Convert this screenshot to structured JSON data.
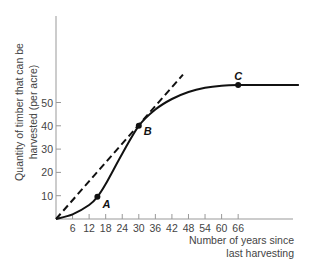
{
  "chart_data": {
    "type": "line",
    "title": "",
    "xlabel": "Number of years since last harvesting",
    "xlabel_lines": [
      "Number of years since",
      "last harvesting"
    ],
    "ylabel": "Quantity of timber that can be harvested (per acre)",
    "ylabel_lines": [
      "Quantity of timber that can be",
      "harvested (per acre)"
    ],
    "x_ticks": [
      6,
      12,
      18,
      24,
      30,
      36,
      42,
      48,
      54,
      60,
      66
    ],
    "y_ticks": [
      10,
      20,
      30,
      40,
      50
    ],
    "xlim": [
      0,
      88
    ],
    "ylim": [
      0,
      87
    ],
    "grid": false,
    "legend": null,
    "series": [
      {
        "name": "Timber growth curve",
        "style": "solid",
        "x": [
          0,
          6,
          12,
          15,
          18,
          24,
          30,
          36,
          42,
          48,
          54,
          60,
          66,
          76,
          88
        ],
        "y": [
          0,
          2,
          6,
          9.5,
          15,
          28,
          40,
          47,
          51.5,
          54.5,
          56.3,
          57.2,
          57.5,
          57.5,
          57.5
        ]
      },
      {
        "name": "Tangent ray from origin",
        "style": "dashed",
        "x": [
          0,
          46
        ],
        "y": [
          0,
          62
        ]
      }
    ],
    "annotations": [
      {
        "label": "A",
        "x": 15,
        "y": 9.5
      },
      {
        "label": "B",
        "x": 30,
        "y": 40
      },
      {
        "label": "C",
        "x": 66,
        "y": 57.5
      }
    ]
  }
}
